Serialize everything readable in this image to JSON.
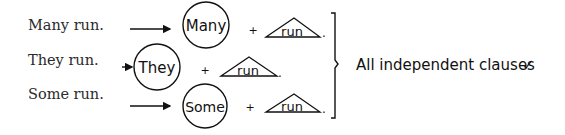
{
  "sentences": [
    {
      "text": "Many run.",
      "subject": "Many",
      "verb": "run"
    },
    {
      "text": "They run.",
      "subject": "They",
      "verb": "run"
    },
    {
      "text": "Some run.",
      "subject": "Some",
      "verb": "run"
    }
  ],
  "operator": "+",
  "period": ".",
  "conclusion": "All independent clauses",
  "check_mark": "✓",
  "colors": {
    "ink": "#111111",
    "text": "#2a2a2a",
    "background": "#ffffff"
  }
}
